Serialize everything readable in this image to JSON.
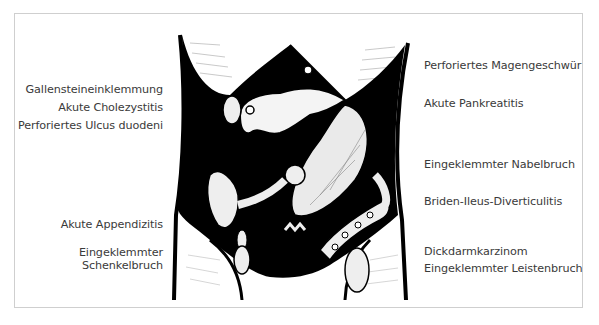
{
  "figure": {
    "left_labels": [
      "Gallensteineinklemmung",
      "Akute Cholezystitis",
      "Perforiertes  Ulcus duodeni",
      "Akute Appendizitis",
      "Eingeklemmter",
      "Schenkelbruch"
    ],
    "right_labels": [
      "Perforiertes Magengeschwür",
      "Akute Pankreatitis",
      "Eingeklemmter Nabelbruch",
      "Briden-Ileus-Diverticulitis",
      "Dickdarmkarzinom",
      "Eingeklemmter Leistenbruch"
    ],
    "colors": {
      "ink": "#000000",
      "text": "#3a3a3a",
      "frame": "#cfcfcf",
      "paper": "#ffffff"
    }
  }
}
